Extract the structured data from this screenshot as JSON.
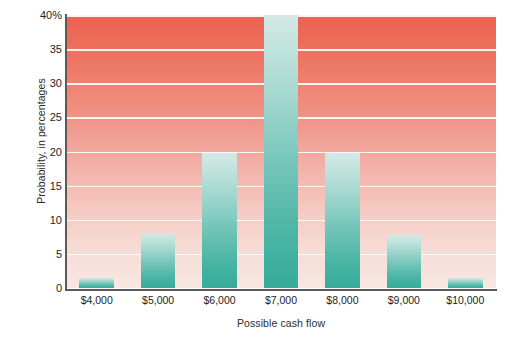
{
  "chart_data": {
    "type": "bar",
    "title": "",
    "xlabel": "Possible cash flow",
    "ylabel": "Probability, in percentages",
    "categories": [
      "$4,000",
      "$5,000",
      "$6,000",
      "$7,000",
      "$8,000",
      "$9,000",
      "$10,000"
    ],
    "values": [
      1.5,
      8,
      19.8,
      40,
      19.8,
      7.7,
      1.5
    ],
    "ylim": [
      0,
      40
    ],
    "yticks": [
      0,
      5,
      10,
      15,
      20,
      25,
      30,
      35,
      40
    ],
    "ytick_labels": [
      "0",
      "5",
      "10",
      "15",
      "20",
      "25",
      "30",
      "35",
      "40%"
    ],
    "grid": true,
    "legend": "none",
    "colors": {
      "bar_top": "#d3e9e5",
      "bar_bottom": "#37ab99",
      "background_top": "#ec6352",
      "background_bottom": "#f8e7e2",
      "gridline": "#ffffff",
      "axis": "#5a5a5a",
      "text": "#1e1e1e"
    }
  }
}
